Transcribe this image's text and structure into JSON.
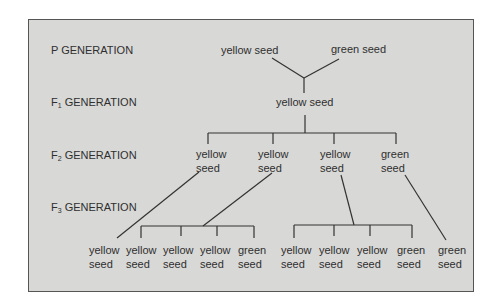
{
  "generations": {
    "p": {
      "prefix": "P",
      "sub": "",
      "suffix": " GENERATION"
    },
    "f1": {
      "prefix": "F",
      "sub": "1",
      "suffix": " GENERATION"
    },
    "f2": {
      "prefix": "F",
      "sub": "2",
      "suffix": " GENERATION"
    },
    "f3": {
      "prefix": "F",
      "sub": "3",
      "suffix": " GENERATION"
    }
  },
  "p_generation": [
    "yellow seed",
    "green seed"
  ],
  "f1_generation": [
    "yellow seed"
  ],
  "f2_generation": [
    {
      "line1": "yellow",
      "line2": "seed"
    },
    {
      "line1": "yellow",
      "line2": "seed"
    },
    {
      "line1": "yellow",
      "line2": "seed"
    },
    {
      "line1": "green",
      "line2": "seed"
    }
  ],
  "f3_generation": [
    {
      "line1": "yellow",
      "line2": "seed"
    },
    {
      "line1": "yellow",
      "line2": "seed"
    },
    {
      "line1": "yellow",
      "line2": "seed"
    },
    {
      "line1": "yellow",
      "line2": "seed"
    },
    {
      "line1": "green",
      "line2": "seed"
    },
    {
      "line1": "yellow",
      "line2": "seed"
    },
    {
      "line1": "yellow",
      "line2": "seed"
    },
    {
      "line1": "yellow",
      "line2": "seed"
    },
    {
      "line1": "green",
      "line2": "seed"
    },
    {
      "line1": "green",
      "line2": "seed"
    }
  ]
}
